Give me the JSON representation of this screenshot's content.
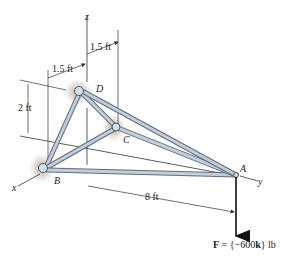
{
  "figure": {
    "type": "space truss",
    "axes": {
      "x": "x",
      "y": "y",
      "z": "z"
    },
    "joints": [
      {
        "name": "A",
        "label": "A"
      },
      {
        "name": "B",
        "label": "B"
      },
      {
        "name": "C",
        "label": "C"
      },
      {
        "name": "D",
        "label": "D"
      }
    ],
    "members": [
      "AB",
      "AC",
      "AD",
      "BC",
      "BD",
      "CD"
    ],
    "dimensions": {
      "dim_top": "1.5 ft",
      "dim_left": "1.5 ft",
      "dim_height": "2 ft",
      "dim_length": "8 ft"
    },
    "load": {
      "bold_symbol": "F",
      "equals": " = {−600",
      "unit_vector": "k",
      "suffix": "} lb"
    },
    "colors": {
      "member_fill": "#b9c6d2",
      "member_edge": "#5d6f80",
      "support_shadow": "#b09a85",
      "line": "#333333"
    }
  }
}
